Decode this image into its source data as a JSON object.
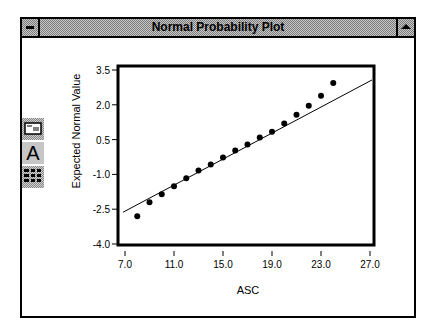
{
  "window": {
    "title": "Normal Probability Plot",
    "system_menu_icon": "system-menu-icon",
    "maximize_icon": "maximize-icon"
  },
  "toolbar": {
    "items": [
      {
        "name": "chart-editor-icon"
      },
      {
        "name": "text-tool-icon",
        "label": "A"
      },
      {
        "name": "data-table-icon"
      }
    ]
  },
  "chart_data": {
    "type": "scatter",
    "title": "Normal Probability Plot",
    "xlabel": "ASC",
    "ylabel": "Expected Normal Value",
    "xlim": [
      7.0,
      27.0
    ],
    "ylim": [
      -4.0,
      3.5
    ],
    "x_ticks": [
      "7.0",
      "11.0",
      "15.0",
      "19.0",
      "23.0",
      "27.0"
    ],
    "y_ticks": [
      "3.5",
      "2.0",
      "0.5",
      "-1.0",
      "-2.5",
      "-4.0"
    ],
    "grid": false,
    "legend": null,
    "series": [
      {
        "name": "ASC",
        "x": [
          8,
          9,
          10,
          11,
          12,
          13,
          14,
          15,
          16,
          17,
          18,
          19,
          20,
          21,
          22,
          23,
          24
        ],
        "y": [
          -2.8,
          -2.2,
          -1.86,
          -1.51,
          -1.17,
          -0.83,
          -0.57,
          -0.27,
          0.03,
          0.29,
          0.59,
          0.84,
          1.19,
          1.57,
          1.96,
          2.39,
          2.94
        ]
      }
    ],
    "reference_line": {
      "x": [
        6.84,
        27.16
      ],
      "y": [
        -2.63,
        3.07
      ]
    }
  }
}
